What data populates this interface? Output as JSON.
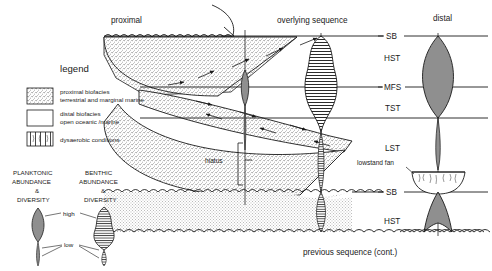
{
  "figure": {
    "title_top_left": "proximal",
    "title_top_center": "overlying sequence",
    "title_top_right": "distal",
    "bottom_caption": "previous sequence (cont.)",
    "hiatus_label": "hiatus",
    "lowstand_fan_label": "lowstand fan"
  },
  "sequence_labels": [
    {
      "id": "sb-top",
      "text": "SB",
      "x": 390,
      "y": 36
    },
    {
      "id": "hst-top",
      "text": "HST",
      "x": 388,
      "y": 58
    },
    {
      "id": "mfs",
      "text": "MFS",
      "x": 387,
      "y": 87
    },
    {
      "id": "tst",
      "text": "TST",
      "x": 389,
      "y": 108
    },
    {
      "id": "lst",
      "text": "LST",
      "x": 389,
      "y": 148
    },
    {
      "id": "sb-low",
      "text": "SB",
      "x": 390,
      "y": 192
    },
    {
      "id": "hst-low",
      "text": "HST",
      "x": 388,
      "y": 221
    }
  ],
  "legend": {
    "heading": "legend",
    "items": [
      {
        "swatch": "stipple",
        "line1": "proximal biofacies",
        "line2": "terrestrial and marginal marine"
      },
      {
        "swatch": "white",
        "line1": "distal biofacies",
        "line2": "open oceanic /marine"
      },
      {
        "swatch": "dysaerobic",
        "line1": "dysaerobic conditions",
        "line2": ""
      }
    ]
  },
  "key": {
    "planktonic": {
      "l1": "PLANKTONIC",
      "l2": "ABUNDANCE",
      "l3": "&",
      "l4": "DIVERSITY"
    },
    "benthic": {
      "l1": "BENTHIC",
      "l2": "ABUNDANCE",
      "l3": "&",
      "l4": "DIVERSITY"
    },
    "high_label": "high",
    "low_label": "low"
  },
  "colors": {
    "ink": "#1a1a1a",
    "stipple_fill": "#efefef",
    "spindle_gray": "#8f8f8f",
    "hatch": "#2b2b2b",
    "paper": "#ffffff"
  }
}
